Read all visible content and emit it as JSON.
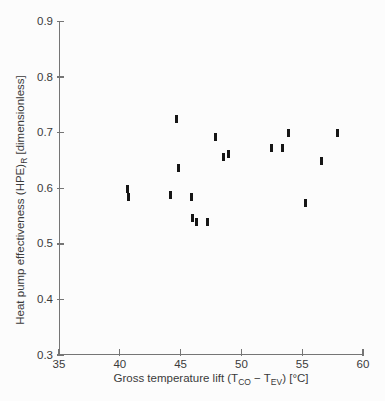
{
  "figure": {
    "background_color": "#fcfcfc",
    "axis_color": "#757575",
    "text_color": "#3a3a3a",
    "marker_color": "#161616"
  },
  "chart_data": {
    "type": "scatter",
    "title": "",
    "xlabel": "Gross temperature lift (T_CO − T_EV) [°C]",
    "xlabel_parts": {
      "pre": "Gross temperature lift (T",
      "sub1": "CO",
      "mid": " − T",
      "sub2": "EV",
      "post": ") [°C]"
    },
    "ylabel": "Heat pump effectiveness (HPE)_R [dimensionless]",
    "ylabel_parts": {
      "pre": "Heat pump effectiveness (HPE)",
      "sub": "R",
      "post": " [dimensionless]"
    },
    "xlim": [
      35,
      60
    ],
    "ylim": [
      0.3,
      0.9
    ],
    "x_ticks": [
      35,
      40,
      45,
      50,
      55,
      60
    ],
    "y_ticks": [
      0.3,
      0.4,
      0.5,
      0.6,
      0.7,
      0.8,
      0.9
    ],
    "grid": false,
    "legend": null,
    "marker_style": "vertical-dash",
    "points": [
      {
        "x": 40.6,
        "y": 0.598
      },
      {
        "x": 40.7,
        "y": 0.584
      },
      {
        "x": 44.2,
        "y": 0.587
      },
      {
        "x": 44.7,
        "y": 0.725
      },
      {
        "x": 44.8,
        "y": 0.637
      },
      {
        "x": 45.9,
        "y": 0.585
      },
      {
        "x": 46.0,
        "y": 0.546
      },
      {
        "x": 46.3,
        "y": 0.539
      },
      {
        "x": 47.2,
        "y": 0.539
      },
      {
        "x": 47.9,
        "y": 0.692
      },
      {
        "x": 48.5,
        "y": 0.656
      },
      {
        "x": 48.9,
        "y": 0.661
      },
      {
        "x": 52.5,
        "y": 0.672
      },
      {
        "x": 53.4,
        "y": 0.672
      },
      {
        "x": 53.9,
        "y": 0.7
      },
      {
        "x": 55.3,
        "y": 0.574
      },
      {
        "x": 56.6,
        "y": 0.649
      },
      {
        "x": 57.9,
        "y": 0.7
      }
    ]
  }
}
